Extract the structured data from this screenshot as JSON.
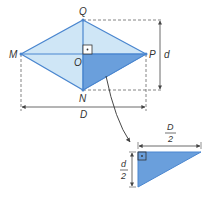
{
  "diagram": {
    "vertices": {
      "Q": {
        "label": "Q",
        "x": 83,
        "y": 20
      },
      "N": {
        "label": "N",
        "x": 83,
        "y": 90
      },
      "M": {
        "label": "M",
        "x": 21,
        "y": 54
      },
      "P": {
        "label": "P",
        "x": 146,
        "y": 54
      },
      "O": {
        "label": "O",
        "x": 83,
        "y": 54
      }
    },
    "dimensions": {
      "short_diagonal": "d",
      "long_diagonal": "D",
      "half_long_num": "D",
      "half_long_den": "2",
      "half_short_num": "d",
      "half_short_den": "2"
    },
    "colors": {
      "light_fill": "#cfe6f6",
      "dark_fill": "#6a9fdc",
      "stroke": "#4a86cf",
      "dim_line": "#444444",
      "text": "#333333"
    }
  }
}
